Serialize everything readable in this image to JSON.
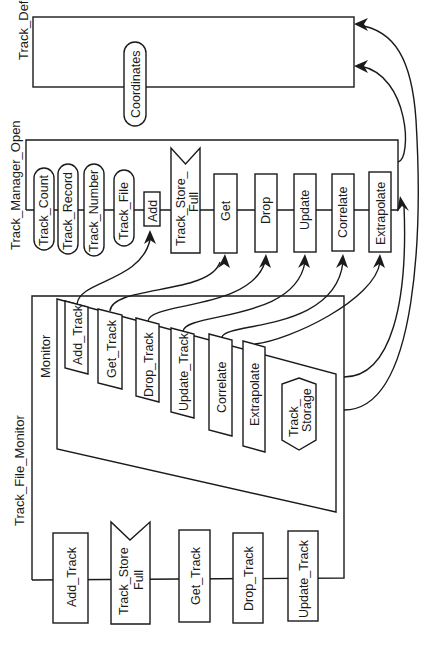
{
  "diagram": {
    "type": "ada-package-dependency-diagram",
    "orientation": "rotated-90-ccw",
    "colors": {
      "line": "#1a1a1a",
      "background": "#ffffff"
    },
    "packages": {
      "track_defs": {
        "title": "Track_Defs",
        "exports": [
          "Coordinates"
        ]
      },
      "track_manager_open": {
        "title": "Track_Manager_Open",
        "types": [
          "Track_Count",
          "Track_Record",
          "Track_Number",
          "Track_File"
        ],
        "operations": [
          "Add",
          "Get",
          "Drop",
          "Update",
          "Correlate",
          "Extrapolate"
        ],
        "exceptions": {
          "line1": "Track_Store_",
          "line2": "Full"
        }
      },
      "track_file_monitor": {
        "title": "Track_File_Monitor",
        "operations": [
          "Add_Track",
          "Get_Track",
          "Drop_Track",
          "Update_Track"
        ],
        "exceptions": {
          "line1": "Track_Store",
          "line2": "Full"
        },
        "monitor": {
          "title": "Monitor",
          "entries": [
            "Add_Track",
            "Get_Track",
            "Drop_Track",
            "Update_Track",
            "Correlate",
            "Extrapolate"
          ],
          "storage": {
            "line1": "Track_",
            "line2": "Storage"
          }
        }
      }
    },
    "connections": [
      {
        "from": "Monitor.Add_Track",
        "to": "Track_Manager_Open.Add"
      },
      {
        "from": "Monitor.Get_Track",
        "to": "Track_Manager_Open.Get"
      },
      {
        "from": "Monitor.Drop_Track",
        "to": "Track_Manager_Open.Drop"
      },
      {
        "from": "Monitor.Update_Track",
        "to": "Track_Manager_Open.Update"
      },
      {
        "from": "Monitor.Correlate",
        "to": "Track_Manager_Open.Correlate"
      },
      {
        "from": "Monitor.Extrapolate",
        "to": "Track_Manager_Open.Extrapolate"
      },
      {
        "from": "Track_File_Monitor",
        "to": "Track_Manager_Open"
      },
      {
        "from": "Track_File_Monitor",
        "to": "Track_Defs"
      },
      {
        "from": "Track_Manager_Open",
        "to": "Track_Defs.Coordinates"
      }
    ]
  }
}
